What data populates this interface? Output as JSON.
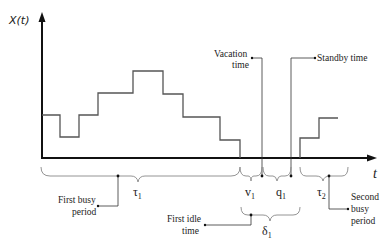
{
  "diagram": {
    "y_axis_label": "X(t)",
    "x_axis_label": "t",
    "colors": {
      "axis": "#111111",
      "step": "#555555",
      "brace": "#888888",
      "leader": "#333333",
      "text": "#222222"
    },
    "symbols": {
      "tau1": {
        "base": "τ",
        "sub": "1"
      },
      "v1": {
        "base": "v",
        "sub": "1"
      },
      "q1": {
        "base": "q",
        "sub": "1"
      },
      "tau2": {
        "base": "τ",
        "sub": "2"
      },
      "delta1": {
        "base": "δ",
        "sub": "1"
      }
    },
    "annotations": {
      "vacation_time": {
        "line1": "Vacation",
        "line2": "time"
      },
      "standby_time": {
        "line1": "Standby time"
      },
      "first_busy_period": {
        "line1": "First busy",
        "line2": "period"
      },
      "first_idle_time": {
        "line1": "First idle",
        "line2": "time"
      },
      "second_busy_period": {
        "line1": "Second",
        "line2": "busy",
        "line3": "period"
      }
    },
    "step_path_first_busy": "42,115 60,115 60,137 79,137 79,115 98,115 98,93 133,93 133,71 163,71 163,94 183,94 183,117 220,117 220,140 240,140 240,158",
    "step_path_second_busy": "300,158 300,138 319,138 319,118 338,118"
  }
}
